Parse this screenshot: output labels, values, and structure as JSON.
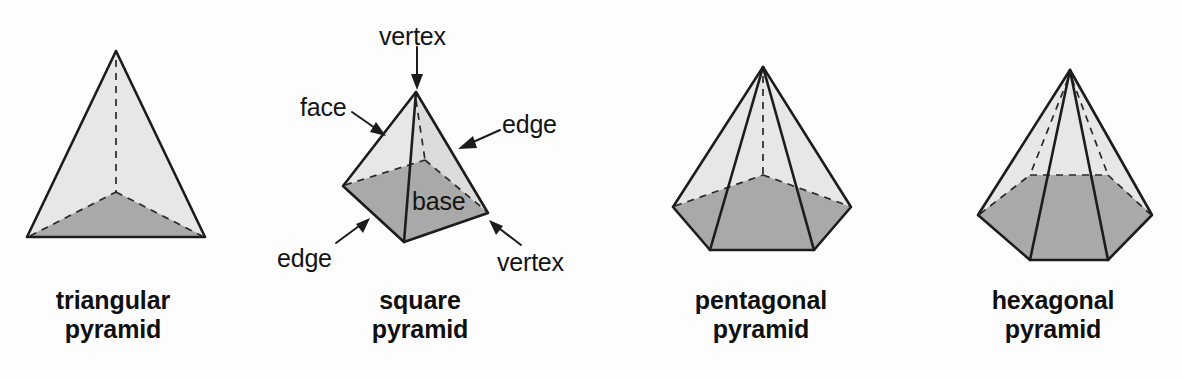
{
  "figure": {
    "background_color": "#fdfdfd",
    "colors": {
      "lateral_face": "#e7e7e7",
      "lateral_face_shaded": "#dcdcdc",
      "base_face": "#a9a9a9",
      "outline": "#1c1c1c",
      "hidden_edge": "#2a2a2a",
      "text": "#141414"
    }
  },
  "shapes": [
    {
      "id": "triangular-pyramid",
      "caption_line1": "triangular",
      "caption_line2": "pyramid",
      "base_sides": 3,
      "caption_center_x": 113,
      "caption_top_y": 286
    },
    {
      "id": "square-pyramid",
      "caption_line1": "square",
      "caption_line2": "pyramid",
      "base_sides": 4,
      "caption_center_x": 420,
      "caption_top_y": 286
    },
    {
      "id": "pentagonal-pyramid",
      "caption_line1": "pentagonal",
      "caption_line2": "pyramid",
      "base_sides": 5,
      "caption_center_x": 761,
      "caption_top_y": 286
    },
    {
      "id": "hexagonal-pyramid",
      "caption_line1": "hexagonal",
      "caption_line2": "pyramid",
      "base_sides": 6,
      "caption_center_x": 1053,
      "caption_top_y": 286
    }
  ],
  "callouts": [
    {
      "id": "vertex-top",
      "label": "vertex",
      "x": 379,
      "y": 22,
      "points_to": "apex"
    },
    {
      "id": "face-left",
      "label": "face",
      "x": 300,
      "y": 93,
      "points_to": "left-lateral-face"
    },
    {
      "id": "edge-right",
      "label": "edge",
      "x": 502,
      "y": 110,
      "points_to": "right-lateral-edge"
    },
    {
      "id": "base-label",
      "label": "base",
      "x": 412,
      "y": 187,
      "points_to": "base-face"
    },
    {
      "id": "edge-bottom-left",
      "label": "edge",
      "x": 277,
      "y": 244,
      "points_to": "front-left-base-edge"
    },
    {
      "id": "vertex-bottom-right",
      "label": "vertex",
      "x": 497,
      "y": 248,
      "points_to": "right-base-vertex"
    }
  ]
}
